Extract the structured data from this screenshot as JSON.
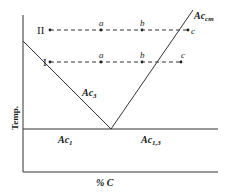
{
  "diagram": {
    "y_axis_label": "Temp.",
    "x_axis_label": "% C",
    "lines": {
      "ac3": {
        "label": "Ac",
        "sub": "3"
      },
      "accm": {
        "label": "Ac",
        "sub": "cm"
      },
      "ac1": {
        "label": "Ac",
        "sub": "1"
      },
      "ac13": {
        "label": "Ac",
        "sub": "1,3"
      }
    },
    "paths": [
      {
        "name": "II",
        "points": [
          "a",
          "b",
          "c"
        ]
      },
      {
        "name": "I",
        "points": [
          "a",
          "b",
          "c"
        ]
      }
    ],
    "colors": {
      "ink": "#2a2a2a",
      "background": "#ffffff"
    }
  }
}
